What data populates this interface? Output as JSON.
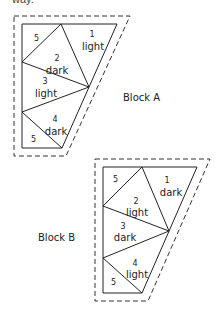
{
  "top_text": "way.",
  "blocks": [
    {
      "name": "Block A",
      "pieces": [
        {
          "num": "1",
          "shade": "light"
        },
        {
          "num": "2",
          "shade": "dark"
        },
        {
          "num": "3",
          "shade": "light"
        },
        {
          "num": "4",
          "shade": "dark"
        },
        {
          "num": "5",
          "shade": ""
        },
        {
          "num": "5",
          "shade": ""
        }
      ]
    },
    {
      "name": "Block B",
      "pieces": [
        {
          "num": "1",
          "shade": "dark"
        },
        {
          "num": "2",
          "shade": "light"
        },
        {
          "num": "3",
          "shade": "dark"
        },
        {
          "num": "4",
          "shade": "light"
        },
        {
          "num": "5",
          "shade": ""
        },
        {
          "num": "5",
          "shade": ""
        }
      ]
    }
  ]
}
